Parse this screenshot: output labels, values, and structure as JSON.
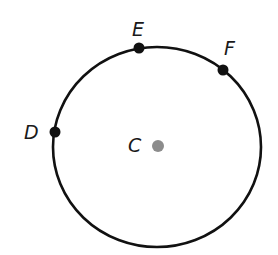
{
  "diagram": {
    "type": "circle-with-points",
    "circle": {
      "center_label": "C",
      "stroke_color": "#111111"
    },
    "points": [
      {
        "label": "E",
        "color": "#111111"
      },
      {
        "label": "F",
        "color": "#111111"
      },
      {
        "label": "D",
        "color": "#111111"
      },
      {
        "label": "C",
        "color": "#8c8c8c"
      }
    ]
  }
}
